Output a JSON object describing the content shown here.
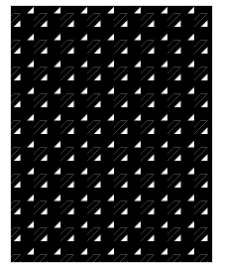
{
  "image": {
    "subject": "houndstooth pattern swatch",
    "colors": {
      "foreground": "#000000",
      "background": "#ffffff",
      "border": "#d8d8d8"
    },
    "tile_size_px": 27
  }
}
